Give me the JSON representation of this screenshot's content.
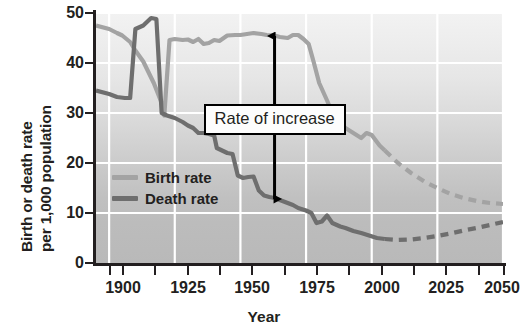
{
  "chart_data": {
    "type": "line",
    "title": "",
    "xlabel": "Year",
    "ylabel_line1": "Birth or death rate",
    "ylabel_line2": "per 1,000 population",
    "xlim": [
      1895,
      2050
    ],
    "ylim": [
      0,
      50
    ],
    "xticks": [
      1900,
      1925,
      1950,
      1975,
      2000,
      2025,
      2050
    ],
    "xtick_labels": [
      "1900",
      "1925",
      "1950",
      "1975",
      "2000",
      "2025",
      "2050"
    ],
    "yticks": [
      0,
      10,
      20,
      30,
      40,
      50
    ],
    "ytick_labels": [
      "0",
      "10",
      "20",
      "30",
      "40",
      "50"
    ],
    "grid": "white gridlines at y ticks 10,20,30,40 and at x ticks",
    "legend_position": "inside-left-lower",
    "background": "vertical gray gradient, light at top to darker at bottom",
    "series": [
      {
        "name": "Birth rate",
        "color": "#a3a3a3",
        "observed": [
          [
            1895,
            47.5
          ],
          [
            1900,
            46.8
          ],
          [
            1903,
            46.0
          ],
          [
            1905,
            45.5
          ],
          [
            1908,
            44.2
          ],
          [
            1910,
            42.5
          ],
          [
            1913,
            40.3
          ],
          [
            1917,
            36.0
          ],
          [
            1920,
            32.0
          ],
          [
            1921,
            29.5
          ],
          [
            1923,
            44.6
          ],
          [
            1925,
            44.8
          ],
          [
            1928,
            44.6
          ],
          [
            1930,
            44.7
          ],
          [
            1932,
            44.2
          ],
          [
            1934,
            44.8
          ],
          [
            1936,
            43.8
          ],
          [
            1938,
            44.0
          ],
          [
            1940,
            44.6
          ],
          [
            1942,
            44.4
          ],
          [
            1945,
            45.5
          ],
          [
            1948,
            45.6
          ],
          [
            1950,
            45.6
          ],
          [
            1955,
            46.0
          ],
          [
            1958,
            45.8
          ],
          [
            1960,
            45.6
          ],
          [
            1963,
            45.5
          ],
          [
            1965,
            45.2
          ],
          [
            1968,
            45.0
          ],
          [
            1970,
            45.6
          ],
          [
            1972,
            45.6
          ],
          [
            1974,
            44.8
          ],
          [
            1976,
            43.8
          ],
          [
            1978,
            40.0
          ],
          [
            1980,
            36.0
          ],
          [
            1983,
            32.5
          ],
          [
            1985,
            30.0
          ],
          [
            1988,
            28.0
          ],
          [
            1990,
            27.0
          ],
          [
            1993,
            26.0
          ],
          [
            1996,
            25.0
          ],
          [
            1998,
            26.0
          ],
          [
            2000,
            25.6
          ],
          [
            2003,
            23.5
          ],
          [
            2005,
            22.5
          ]
        ],
        "projected": [
          [
            2005,
            22.5
          ],
          [
            2010,
            20.0
          ],
          [
            2015,
            18.0
          ],
          [
            2020,
            16.3
          ],
          [
            2025,
            15.0
          ],
          [
            2030,
            13.8
          ],
          [
            2035,
            13.0
          ],
          [
            2040,
            12.4
          ],
          [
            2045,
            12.0
          ],
          [
            2050,
            11.8
          ]
        ],
        "style_observed": "solid",
        "style_projected": "dashed"
      },
      {
        "name": "Death rate",
        "color": "#6e6e6e",
        "observed": [
          [
            1895,
            34.5
          ],
          [
            1900,
            33.8
          ],
          [
            1903,
            33.2
          ],
          [
            1906,
            33.0
          ],
          [
            1908,
            33.0
          ],
          [
            1910,
            46.8
          ],
          [
            1913,
            47.5
          ],
          [
            1916,
            49.0
          ],
          [
            1918,
            48.8
          ],
          [
            1920,
            30.0
          ],
          [
            1922,
            29.5
          ],
          [
            1925,
            29.0
          ],
          [
            1928,
            28.2
          ],
          [
            1930,
            27.5
          ],
          [
            1932,
            27.0
          ],
          [
            1934,
            26.0
          ],
          [
            1936,
            26.0
          ],
          [
            1938,
            25.8
          ],
          [
            1940,
            25.5
          ],
          [
            1941,
            23.0
          ],
          [
            1943,
            22.5
          ],
          [
            1945,
            22.0
          ],
          [
            1947,
            21.8
          ],
          [
            1949,
            17.5
          ],
          [
            1951,
            17.0
          ],
          [
            1953,
            17.2
          ],
          [
            1955,
            17.3
          ],
          [
            1957,
            14.5
          ],
          [
            1959,
            13.5
          ],
          [
            1961,
            13.2
          ],
          [
            1963,
            13.0
          ],
          [
            1965,
            12.6
          ],
          [
            1968,
            12.0
          ],
          [
            1970,
            11.6
          ],
          [
            1972,
            11.0
          ],
          [
            1975,
            10.5
          ],
          [
            1977,
            10.0
          ],
          [
            1979,
            8.0
          ],
          [
            1981,
            8.3
          ],
          [
            1983,
            9.5
          ],
          [
            1985,
            8.0
          ],
          [
            1988,
            7.3
          ],
          [
            1990,
            7.0
          ],
          [
            1993,
            6.4
          ],
          [
            1996,
            6.0
          ],
          [
            1999,
            5.5
          ],
          [
            2002,
            5.0
          ],
          [
            2005,
            4.8
          ]
        ],
        "projected": [
          [
            2005,
            4.8
          ],
          [
            2010,
            4.6
          ],
          [
            2015,
            4.7
          ],
          [
            2020,
            5.0
          ],
          [
            2025,
            5.4
          ],
          [
            2030,
            5.9
          ],
          [
            2035,
            6.5
          ],
          [
            2040,
            7.0
          ],
          [
            2045,
            7.6
          ],
          [
            2050,
            8.2
          ]
        ],
        "style_observed": "solid",
        "style_projected": "dashed"
      }
    ],
    "annotations": [
      {
        "type": "label-box",
        "text": "Rate of increase",
        "x": 1963,
        "y_top": 45.4,
        "y_bottom": 12.8,
        "arrow": "double-headed-vertical",
        "arrow_color": "#000000",
        "box_border_color": "#000000",
        "box_fill_color": "#fdfdfd"
      }
    ]
  },
  "legend": {
    "items": [
      {
        "label": "Birth rate",
        "color": "#a3a3a3"
      },
      {
        "label": "Death rate",
        "color": "#6e6e6e"
      }
    ]
  },
  "annotation": {
    "text": "Rate of increase"
  },
  "axes": {
    "xlabel": "Year",
    "ylabel_line1": "Birth or death rate",
    "ylabel_line2": "per 1,000 population"
  }
}
